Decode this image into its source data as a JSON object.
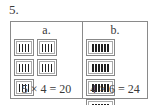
{
  "problem": {
    "number": "5."
  },
  "panels": [
    {
      "id": "a",
      "label": "a.",
      "group_count": 5,
      "items_per_group": 4,
      "equation": "5 × 4 = 20"
    },
    {
      "id": "b",
      "label": "b.",
      "group_count": 4,
      "items_per_group": 6,
      "equation": "4 × 6 = 24"
    }
  ],
  "colors": {
    "border": "#8a8a8a",
    "bar": "#222222",
    "text": "#3a3a3a"
  }
}
